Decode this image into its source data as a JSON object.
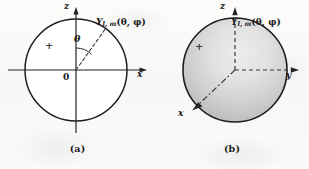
{
  "figure": {
    "background_color": "#fbfbfa",
    "ink_color": "#1d1d1d",
    "panels": [
      {
        "id": "a",
        "caption": "(a)",
        "kind": "cross-section-circle",
        "filled": false,
        "fill_color": "#ffffff",
        "outline_color": "#1d1d1d",
        "axes": [
          {
            "name": "z-axis",
            "label": "z",
            "direction": "up",
            "style": "solid",
            "arrow": true
          },
          {
            "name": "x-axis",
            "label": "x",
            "direction": "right",
            "style": "solid",
            "arrow": true
          }
        ],
        "annotations": {
          "origin_label": "0",
          "sign_label": "+",
          "angle_label": "θ",
          "radial_line_style": "dashed",
          "angle_from_axis": "z"
        },
        "harmonic_label": {
          "symbol": "Y",
          "subscript": "l, m",
          "arguments": "(θ, φ)",
          "full": "Y l,m (θ, φ)"
        }
      },
      {
        "id": "b",
        "caption": "(b)",
        "kind": "shaded-sphere",
        "filled": true,
        "fill_color": "#c9c9c9",
        "highlight_color": "#e9e9e9",
        "shadow_color": "#9d9d9d",
        "outline_color": "#1d1d1d",
        "axes": [
          {
            "name": "z-axis",
            "label": "z",
            "direction": "up",
            "style": "dashed",
            "arrow": true
          },
          {
            "name": "y-axis",
            "label": "y",
            "direction": "right",
            "style": "dashed",
            "arrow": true
          },
          {
            "name": "x-axis",
            "label": "x",
            "direction": "down-left",
            "style": "dashed",
            "arrow": true
          }
        ],
        "annotations": {
          "sign_label": "+"
        },
        "harmonic_label": {
          "symbol": "Y",
          "subscript": "l, m",
          "arguments": "(θ, φ)",
          "full": "Y l,m (θ, φ)"
        }
      }
    ]
  }
}
